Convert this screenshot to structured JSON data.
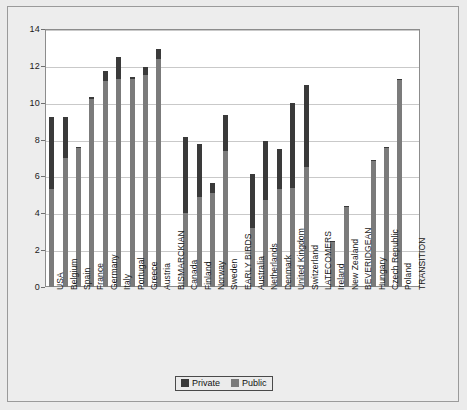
{
  "chart_data": {
    "type": "bar",
    "title": "",
    "subtitle": "",
    "xlabel": "",
    "ylabel": "",
    "ylim": [
      0,
      14
    ],
    "ytick_step": 2,
    "yticks": [
      0,
      2,
      4,
      6,
      8,
      10,
      12,
      14
    ],
    "grid": true,
    "stacked": true,
    "legend_position": "bottom-center",
    "legend": [
      "Private",
      "Public"
    ],
    "colors": {
      "private": "#3a3a3a",
      "public": "#7b7b7b",
      "plot_background": "#ffffff",
      "figure_background": "#ebebeb",
      "gridline": "#c9c9c9",
      "axis": "#8c8c8c",
      "text": "#1a1a1a"
    },
    "series": [
      {
        "name": "Public",
        "values": [
          5.3,
          7.0,
          7.55,
          10.2,
          11.2,
          11.3,
          11.3,
          11.5,
          12.4,
          null,
          4.0,
          4.9,
          5.1,
          7.4,
          null,
          3.2,
          4.7,
          5.3,
          5.35,
          6.5,
          null,
          2.45,
          4.35,
          null,
          6.85,
          7.55,
          11.25,
          null
        ]
      },
      {
        "name": "Private",
        "values": [
          3.9,
          2.25,
          0.05,
          0.1,
          0.5,
          1.2,
          0.1,
          0.45,
          0.5,
          null,
          4.15,
          2.85,
          0.55,
          1.95,
          null,
          2.95,
          3.2,
          2.2,
          4.65,
          4.45,
          null,
          0.05,
          0.05,
          null,
          0.05,
          0.05,
          0.05,
          null
        ]
      }
    ],
    "totals": [
      9.2,
      9.25,
      7.6,
      10.3,
      11.7,
      12.5,
      11.4,
      11.95,
      12.9,
      null,
      8.15,
      7.75,
      5.65,
      9.35,
      null,
      6.15,
      7.9,
      7.5,
      10.0,
      10.95,
      null,
      2.5,
      4.4,
      null,
      6.9,
      7.6,
      11.3,
      null
    ],
    "categories": [
      "USA",
      "Belgium",
      "Spain",
      "France",
      "Germany",
      "Italy",
      "Portugal",
      "Greece",
      "Austria",
      "BISMARCKIAN",
      "Canada",
      "Finland",
      "Norway",
      "Sweden",
      "EARLY BIRDS",
      "Australia",
      "Netherlands",
      "Denmark",
      "United Kingdom",
      "Switzerland",
      "LATECOMERS",
      "Ireland",
      "New Zealand",
      "BEVERIDGEAN",
      "Hungary",
      "Czech Republic",
      "Poland",
      "TRANSITION"
    ],
    "group_labels": [
      "BISMARCKIAN",
      "EARLY BIRDS",
      "LATECOMERS",
      "BEVERIDGEAN",
      "TRANSITION"
    ]
  },
  "legend": {
    "private_label": "Private",
    "public_label": "Public"
  }
}
